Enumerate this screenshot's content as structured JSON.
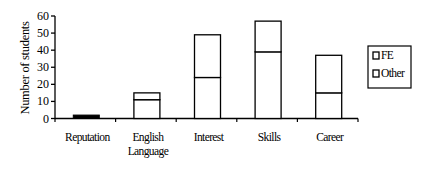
{
  "chart_data": {
    "type": "bar",
    "stacked": true,
    "title": "",
    "xlabel": "",
    "ylabel": "Number of students",
    "ylim": [
      0,
      60
    ],
    "yticks": [
      0,
      10,
      20,
      30,
      40,
      50,
      60
    ],
    "categories": [
      "Reputation",
      "English Language",
      "Interest",
      "Skills",
      "Career"
    ],
    "category_lines": [
      [
        "Reputation"
      ],
      [
        "English",
        "Language"
      ],
      [
        "Interest"
      ],
      [
        "Skills"
      ],
      [
        "Career"
      ]
    ],
    "series": [
      {
        "name": "Other",
        "values": [
          2,
          11,
          24,
          39,
          15
        ]
      },
      {
        "name": "FE",
        "values": [
          0,
          4,
          25,
          18,
          22
        ]
      }
    ],
    "totals": [
      2,
      15,
      49,
      57,
      37
    ],
    "legend": {
      "position": "right",
      "entries": [
        "FE",
        "Other"
      ]
    },
    "grid": false
  },
  "colors": {
    "bar_fill": "#ffffff",
    "bar_stroke": "#000000",
    "reputation_fill": "#000000"
  }
}
